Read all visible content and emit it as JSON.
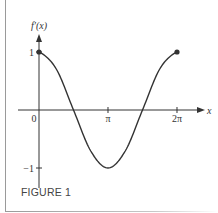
{
  "figure": {
    "caption": "FIGURE 1"
  },
  "chart_data": {
    "type": "line",
    "title": "",
    "function": "f'(x) = cos(x)",
    "xlabel": "x",
    "ylabel": "f′(x)",
    "xlim": [
      0,
      6.2832
    ],
    "ylim": [
      -1,
      1
    ],
    "x_ticks": [
      {
        "value": 0,
        "label": "0"
      },
      {
        "value": 3.14159,
        "label": "π"
      },
      {
        "value": 6.28318,
        "label": "2π"
      }
    ],
    "y_ticks": [
      {
        "value": 1,
        "label": "1"
      },
      {
        "value": -1,
        "label": "−1"
      }
    ],
    "series": [
      {
        "name": "f'(x)",
        "x": [
          0,
          0.7854,
          1.5708,
          2.3562,
          3.1416,
          3.927,
          4.7124,
          5.4978,
          6.2832
        ],
        "values": [
          1,
          0.707,
          0,
          -0.707,
          -1,
          -0.707,
          0,
          0.707,
          1
        ]
      }
    ],
    "endpoints": [
      {
        "x": 0,
        "y": 1,
        "marker": "dot"
      },
      {
        "x": 6.2832,
        "y": 1,
        "marker": "dot"
      }
    ],
    "grid": false,
    "legend": "none"
  }
}
